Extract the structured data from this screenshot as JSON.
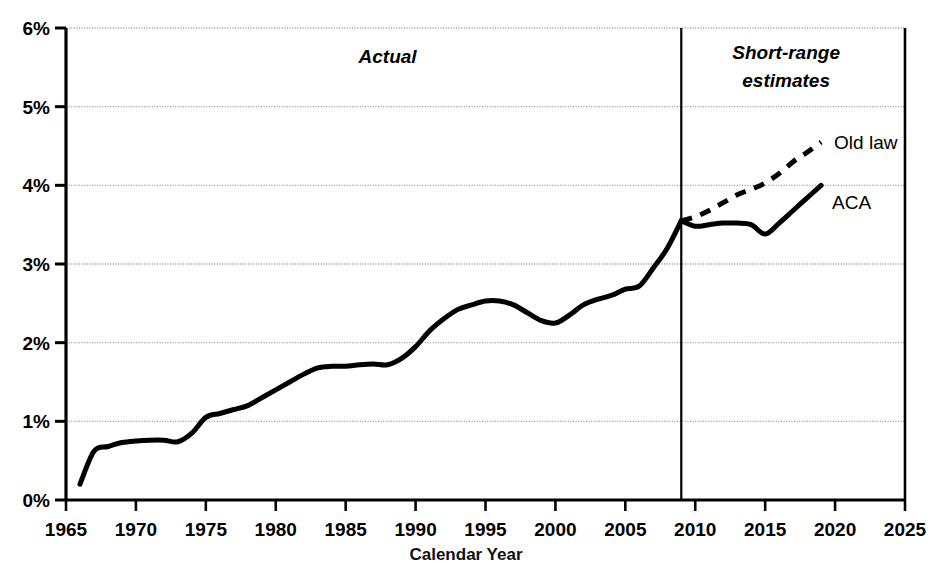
{
  "chart_data": {
    "type": "line",
    "title": "",
    "xlabel": "Calendar Year",
    "ylabel": "",
    "xlim": [
      1965,
      2025
    ],
    "ylim": [
      0,
      6
    ],
    "grid": true,
    "legend_position": "inline-right",
    "x_ticks": [
      "1965",
      "1970",
      "1975",
      "1980",
      "1985",
      "1990",
      "1995",
      "2000",
      "2005",
      "2010",
      "2015",
      "2020",
      "2025"
    ],
    "x_tick_values": [
      1965,
      1970,
      1975,
      1980,
      1985,
      1990,
      1995,
      2000,
      2005,
      2010,
      2015,
      2020,
      2025
    ],
    "y_ticks": [
      "0%",
      "1%",
      "2%",
      "3%",
      "4%",
      "5%",
      "6%"
    ],
    "y_tick_values": [
      0,
      1,
      2,
      3,
      4,
      5,
      6
    ],
    "y_unit": "%",
    "annotations": [
      {
        "name": "actual-region-label",
        "text": "Actual",
        "x": 1988,
        "y": 5.55,
        "style": "bold-italic"
      },
      {
        "name": "short-range-estimates-label",
        "text": "Short-range",
        "x": 2016.5,
        "y": 5.6,
        "style": "bold-italic"
      },
      {
        "name": "short-range-estimates-label-2",
        "text": "estimates",
        "x": 2016.5,
        "y": 5.25,
        "style": "bold-italic"
      }
    ],
    "divider": {
      "name": "forecast-divider",
      "x": 2009,
      "label": ""
    },
    "series": [
      {
        "name": "Actual",
        "label": "",
        "style": "solid",
        "x": [
          1966,
          1967,
          1968,
          1969,
          1970,
          1971,
          1972,
          1973,
          1974,
          1975,
          1976,
          1977,
          1978,
          1979,
          1980,
          1981,
          1982,
          1983,
          1984,
          1985,
          1986,
          1987,
          1988,
          1989,
          1990,
          1991,
          1992,
          1993,
          1994,
          1995,
          1996,
          1997,
          1998,
          1999,
          2000,
          2001,
          2002,
          2003,
          2004,
          2005,
          2006,
          2007,
          2008,
          2009
        ],
        "values": [
          0.2,
          0.62,
          0.68,
          0.73,
          0.75,
          0.76,
          0.76,
          0.74,
          0.85,
          1.05,
          1.1,
          1.15,
          1.2,
          1.3,
          1.4,
          1.5,
          1.6,
          1.68,
          1.7,
          1.7,
          1.72,
          1.73,
          1.72,
          1.8,
          1.95,
          2.15,
          2.3,
          2.42,
          2.48,
          2.53,
          2.53,
          2.48,
          2.38,
          2.28,
          2.25,
          2.35,
          2.48,
          2.55,
          2.6,
          2.68,
          2.72,
          2.95,
          3.2,
          3.55
        ]
      },
      {
        "name": "ACA",
        "label": "ACA",
        "style": "solid",
        "x": [
          2009,
          2010,
          2011,
          2012,
          2013,
          2014,
          2015,
          2016,
          2017,
          2018,
          2019
        ],
        "values": [
          3.55,
          3.48,
          3.5,
          3.52,
          3.52,
          3.5,
          3.38,
          3.52,
          3.68,
          3.84,
          4.0
        ]
      },
      {
        "name": "Old law",
        "label": "Old law",
        "style": "dashed",
        "x": [
          2009,
          2010,
          2011,
          2012,
          2013,
          2014,
          2015,
          2016,
          2017,
          2018,
          2019
        ],
        "values": [
          3.55,
          3.6,
          3.68,
          3.78,
          3.88,
          3.95,
          4.03,
          4.15,
          4.3,
          4.42,
          4.55
        ]
      }
    ],
    "colors": {
      "line": "#000000",
      "grid": "#999999",
      "axis": "#000000",
      "background": "#ffffff",
      "text": "#000000"
    }
  }
}
